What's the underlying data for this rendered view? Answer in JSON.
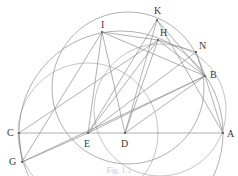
{
  "figure": {
    "caption": "Fig. 1.1",
    "caption_visible": "partially cut off at bottom edge",
    "background_color": "#ffffff",
    "stroke_color": "#8a8a8a",
    "label_color": "#3a3a3a",
    "width": 238,
    "height": 176
  },
  "points": [
    {
      "id": "A",
      "label": "A",
      "x": 223,
      "y": 133,
      "label_x": 227,
      "label_y": 129
    },
    {
      "id": "B",
      "label": "B",
      "x": 205,
      "y": 76,
      "label_x": 210,
      "label_y": 70
    },
    {
      "id": "C",
      "label": "C",
      "x": 19,
      "y": 133,
      "label_x": 7,
      "label_y": 128
    },
    {
      "id": "D",
      "label": "D",
      "x": 125,
      "y": 133,
      "label_x": 121,
      "label_y": 139
    },
    {
      "id": "E",
      "label": "E",
      "x": 88,
      "y": 133,
      "label_x": 84,
      "label_y": 139
    },
    {
      "id": "G",
      "label": "G",
      "x": 22,
      "y": 162,
      "label_x": 9,
      "label_y": 157
    },
    {
      "id": "H",
      "label": "H",
      "x": 158,
      "y": 40,
      "label_x": 160,
      "label_y": 28
    },
    {
      "id": "I",
      "label": "I",
      "x": 102,
      "y": 32,
      "label_x": 101,
      "label_y": 20
    },
    {
      "id": "K",
      "label": "K",
      "x": 157,
      "y": 20,
      "label_x": 154,
      "label_y": 6
    },
    {
      "id": "N",
      "label": "N",
      "x": 196,
      "y": 52,
      "label_x": 199,
      "label_y": 41
    }
  ],
  "circles": [
    {
      "name": "semicircle-on-CA",
      "cx": 121,
      "cy": 133,
      "r": 102
    },
    {
      "name": "main-circle-through-IHB",
      "cx": 128,
      "cy": 88,
      "r": 76
    },
    {
      "name": "arc-G-C-K-center-E",
      "cx": 88,
      "cy": 133,
      "r": 70,
      "partial": true
    },
    {
      "name": "arc-B-to-A",
      "cx": 160,
      "cy": 110,
      "r": 66,
      "partial": true
    }
  ],
  "segments": [
    {
      "name": "baseline-CA",
      "from": "C",
      "to": "A"
    },
    {
      "name": "C-to-H",
      "from": "C",
      "to": "H"
    },
    {
      "name": "C-to-G",
      "from": "C",
      "to": "G"
    },
    {
      "name": "G-to-I",
      "from": "G",
      "to": "I"
    },
    {
      "name": "G-to-B",
      "from": "G",
      "to": "B"
    },
    {
      "name": "G-to-E",
      "from": "G",
      "to": "E"
    },
    {
      "name": "E-to-I",
      "from": "E",
      "to": "I"
    },
    {
      "name": "E-to-K",
      "from": "E",
      "to": "K"
    },
    {
      "name": "E-to-H",
      "from": "E",
      "to": "H"
    },
    {
      "name": "E-to-N",
      "from": "E",
      "to": "N"
    },
    {
      "name": "E-to-B",
      "from": "E",
      "to": "B"
    },
    {
      "name": "D-to-I",
      "from": "D",
      "to": "I"
    },
    {
      "name": "D-to-K",
      "from": "D",
      "to": "K"
    },
    {
      "name": "D-to-H",
      "from": "D",
      "to": "H"
    },
    {
      "name": "D-to-B",
      "from": "D",
      "to": "B"
    },
    {
      "name": "I-to-H",
      "from": "I",
      "to": "H"
    },
    {
      "name": "I-to-B",
      "from": "I",
      "to": "B"
    },
    {
      "name": "K-to-B",
      "from": "K",
      "to": "B"
    },
    {
      "name": "H-to-B",
      "from": "H",
      "to": "B"
    },
    {
      "name": "H-to-N",
      "from": "H",
      "to": "N"
    },
    {
      "name": "N-to-B",
      "from": "N",
      "to": "B"
    },
    {
      "name": "A-to-B",
      "from": "A",
      "to": "B"
    },
    {
      "name": "A-to-K",
      "from": "A",
      "to": "K"
    }
  ]
}
